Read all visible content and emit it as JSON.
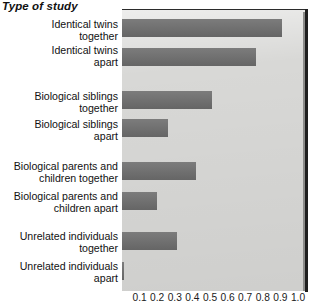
{
  "chart_data": {
    "type": "bar",
    "orientation": "horizontal",
    "title": "Type of study",
    "xlabel": "",
    "ylabel": "",
    "xlim": [
      0,
      1.0
    ],
    "grid": false,
    "legend": null,
    "bar_color": "#6d6d6d",
    "plot_background": "#d8d8d6",
    "categories": [
      "Identical twins together",
      "Identical twins apart",
      "Biological siblings together",
      "Biological siblings apart",
      "Biological parents and children together",
      "Biological parents and children apart",
      "Unrelated individuals together",
      "Unrelated individuals apart"
    ],
    "category_lines": [
      [
        "Identical twins",
        "together"
      ],
      [
        "Identical twins",
        "apart"
      ],
      [
        "Biological siblings",
        "together"
      ],
      [
        "Biological siblings",
        "apart"
      ],
      [
        "Biological parents and",
        "children together"
      ],
      [
        "Biological parents and",
        "children apart"
      ],
      [
        "Unrelated individuals",
        "together"
      ],
      [
        "Unrelated individuals",
        "apart"
      ]
    ],
    "values": [
      0.91,
      0.76,
      0.51,
      0.26,
      0.42,
      0.2,
      0.31,
      0.01
    ],
    "tick_labels": [
      "0.1",
      "0.2",
      "0.3",
      "0.4",
      "0.5",
      "0.6",
      "0.7",
      "0.8",
      "0.9",
      "1.0"
    ],
    "tick_values": [
      0.1,
      0.2,
      0.3,
      0.4,
      0.5,
      0.6,
      0.7,
      0.8,
      0.9,
      1.0
    ]
  },
  "rows": [
    {
      "l1": "Identical twins",
      "l2": "together",
      "value": 0.91,
      "label_top": 18,
      "bar_top": 19
    },
    {
      "l1": "Identical twins",
      "l2": "apart",
      "value": 0.76,
      "label_top": 44,
      "bar_top": 48
    },
    {
      "l1": "Biological siblings",
      "l2": "together",
      "value": 0.51,
      "label_top": 90,
      "bar_top": 91
    },
    {
      "l1": "Biological siblings",
      "l2": "apart",
      "value": 0.26,
      "label_top": 118,
      "bar_top": 119
    },
    {
      "l1": "Biological parents and",
      "l2": "children together",
      "value": 0.42,
      "label_top": 160,
      "bar_top": 162
    },
    {
      "l1": "Biological parents and",
      "l2": "children apart",
      "value": 0.2,
      "label_top": 190,
      "bar_top": 192
    },
    {
      "l1": "Unrelated individuals",
      "l2": "together",
      "value": 0.31,
      "label_top": 230,
      "bar_top": 232
    },
    {
      "l1": "Unrelated individuals",
      "l2": "apart",
      "value": 0.01,
      "label_top": 260,
      "bar_top": 262
    }
  ]
}
